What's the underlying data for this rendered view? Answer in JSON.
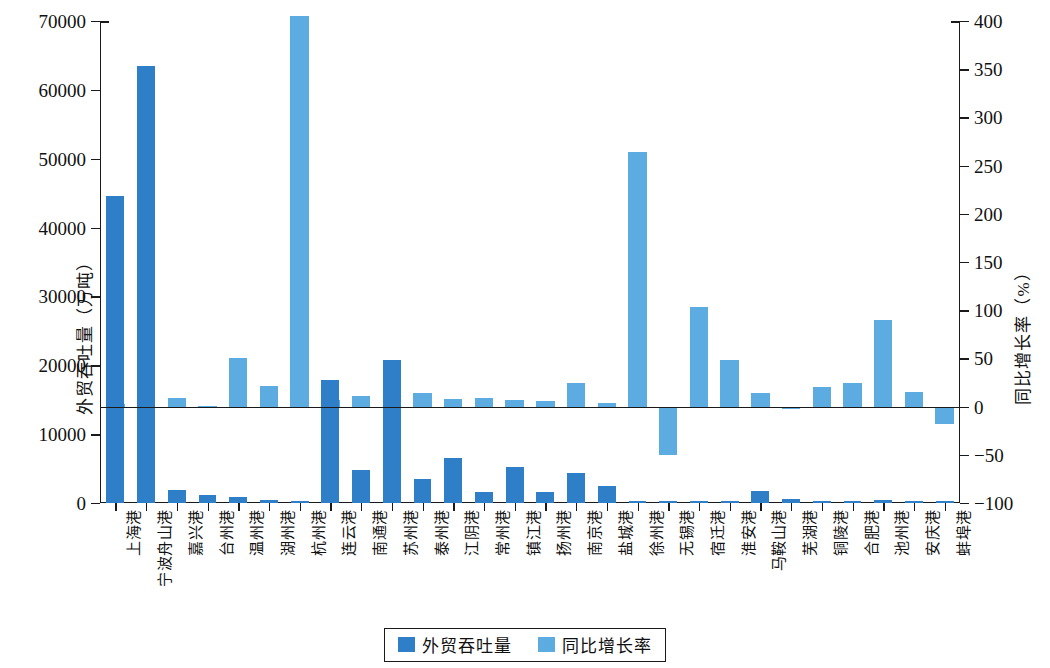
{
  "chart_data": {
    "type": "bar",
    "title": "",
    "xlabel": "",
    "ylabel": "外贸吞吐量（万吨）",
    "y2label": "同比增长率（%）",
    "ylim": [
      0,
      70000
    ],
    "yticks": [
      "0",
      "10000",
      "20000",
      "30000",
      "40000",
      "50000",
      "60000",
      "70000"
    ],
    "y2lim": [
      -100,
      400
    ],
    "y2ticks": [
      "-100",
      "-50",
      "0",
      "50",
      "100",
      "150",
      "200",
      "250",
      "300",
      "350",
      "400"
    ],
    "grid": false,
    "legend_position": "bottom",
    "categories": [
      "上海港",
      "宁波舟山港",
      "嘉兴港",
      "台州港",
      "温州港",
      "湖州港",
      "杭州港",
      "连云港",
      "南通港",
      "苏州港",
      "泰州港",
      "江阴港",
      "常州港",
      "镇江港",
      "扬州港",
      "南京港",
      "盐城港",
      "徐州港",
      "无锡港",
      "宿迁港",
      "淮安港",
      "马鞍山港",
      "芜湖港",
      "铜陵港",
      "合肥港",
      "池州港",
      "安庆港",
      "蚌埠港"
    ],
    "series": [
      {
        "name": "外贸吞吐量",
        "axis": "left",
        "color": "#2F7FC8",
        "unit": "万吨",
        "values": [
          44600,
          63400,
          1900,
          1200,
          800,
          500,
          250,
          17900,
          4800,
          20800,
          3500,
          6600,
          1600,
          5300,
          1600,
          4400,
          2500,
          230,
          220,
          260,
          230,
          1800,
          600,
          280,
          320,
          420,
          330,
          330
        ]
      },
      {
        "name": "同比增长率",
        "axis": "right",
        "color": "#5CACE2",
        "unit": "%",
        "values": [
          3,
          2,
          9,
          1,
          50,
          21,
          405,
          7,
          11,
          13,
          14,
          8,
          9,
          7,
          6,
          25,
          4,
          264,
          -50,
          103,
          48,
          14,
          -2,
          20,
          24,
          90,
          15,
          -18
        ]
      }
    ]
  },
  "legend": {
    "items": [
      {
        "label": "外贸吞吐量",
        "color": "#2F7FC8"
      },
      {
        "label": "同比增长率",
        "color": "#5CACE2"
      }
    ]
  }
}
